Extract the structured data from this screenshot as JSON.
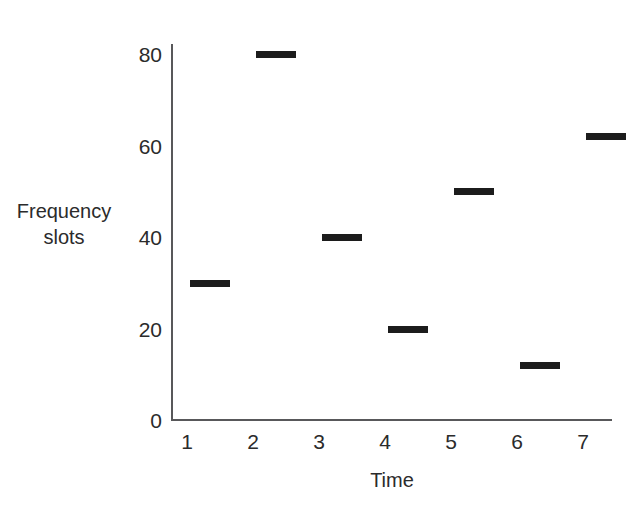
{
  "chart_data": {
    "type": "bar",
    "title": "",
    "subtitle": "",
    "xlabel": "Time",
    "ylabel": "Frequency slots",
    "ylabel_lines": [
      "Frequency",
      "slots"
    ],
    "categories": [
      "1",
      "2",
      "3",
      "4",
      "5",
      "6",
      "7"
    ],
    "x": [
      1,
      2,
      3,
      4,
      5,
      6,
      7
    ],
    "values": [
      30,
      80,
      40,
      20,
      50,
      12,
      62
    ],
    "xtick_labels": [
      "1",
      "2",
      "3",
      "4",
      "5",
      "6",
      "7"
    ],
    "ytick_labels": [
      "0",
      "20",
      "40",
      "60",
      "80"
    ],
    "yticks": [
      0,
      20,
      40,
      60,
      80
    ],
    "ylim": [
      0,
      88
    ],
    "xlim": [
      0.6,
      7.6
    ],
    "grid": false,
    "legend": null,
    "annotations": [],
    "marker_style": "horizontal-dash",
    "series_color": "#1c1c1c",
    "axis_color": "#58585a",
    "background_color": "#ffffff",
    "points": [
      {
        "x": 1,
        "y": 30,
        "label": "30"
      },
      {
        "x": 2,
        "y": 80,
        "label": "80"
      },
      {
        "x": 3,
        "y": 40,
        "label": "40"
      },
      {
        "x": 4,
        "y": 20,
        "label": "20"
      },
      {
        "x": 5,
        "y": 50,
        "label": "50"
      },
      {
        "x": 6,
        "y": 12,
        "label": "12"
      },
      {
        "x": 7,
        "y": 62,
        "label": "62"
      }
    ]
  }
}
